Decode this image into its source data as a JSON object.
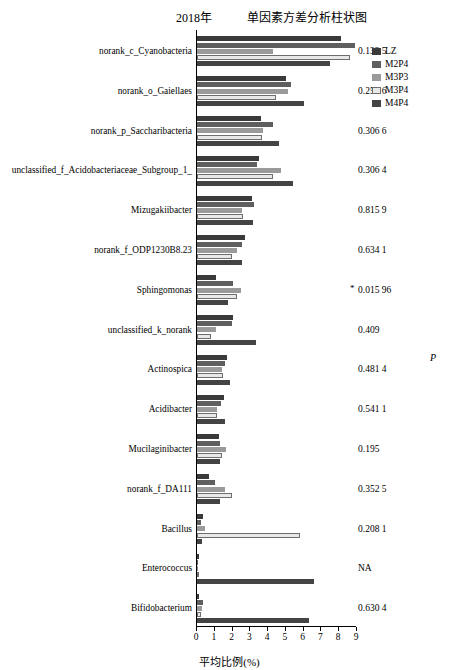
{
  "header": {
    "year": "2018年",
    "title": "单因素方差分析柱状图"
  },
  "legend": {
    "title": "",
    "items": [
      {
        "label": "LZ",
        "color": "#3a3a3a"
      },
      {
        "label": "M2P4",
        "color": "#5f5f5f"
      },
      {
        "label": "M3P3",
        "color": "#9a9a9a"
      },
      {
        "label": "M3P4",
        "color": "#e8e8e8"
      },
      {
        "label": "M4P4",
        "color": "#444444"
      }
    ]
  },
  "p_column_mark": "P",
  "chart_data": {
    "type": "bar",
    "title": "单因素方差分析柱状图",
    "xlabel": "平均比例(%)",
    "ylabel": "",
    "xlim": [
      0,
      9
    ],
    "xticks": [
      0,
      1,
      2,
      3,
      4,
      5,
      6,
      7,
      8,
      9
    ],
    "grid": false,
    "legend_position": "top-right",
    "orientation": "horizontal",
    "categories": [
      "norank_c_Cyanobacteria",
      "norank_o_Gaiellaes",
      "norank_p_Saccharibacteria",
      "unclassified_f_Acidobacteriaceae_Subgroup_1_",
      "Mizugakiibacter",
      "norank_f_ODP1230B8.23",
      "Sphingomonas",
      "unclassified_k_norank",
      "Actinospica",
      "Acidibacter",
      "Mucilaginibacter",
      "norank_f_DA111",
      "Bacillus",
      "Enterococcus",
      "Bifidobacterium"
    ],
    "series": [
      {
        "name": "LZ",
        "values": [
          8.1,
          5.0,
          3.6,
          3.5,
          3.1,
          2.7,
          1.05,
          2.0,
          1.7,
          1.5,
          1.25,
          0.7,
          0.35,
          0.1,
          0.12
        ]
      },
      {
        "name": "M2P4",
        "values": [
          8.9,
          5.3,
          4.3,
          3.4,
          3.2,
          2.55,
          2.05,
          1.95,
          1.55,
          1.35,
          1.3,
          1.0,
          0.25,
          0.08,
          0.35
        ]
      },
      {
        "name": "M3P3",
        "values": [
          4.3,
          5.1,
          3.7,
          4.7,
          2.55,
          2.25,
          2.5,
          1.05,
          1.4,
          1.15,
          1.65,
          1.55,
          0.45,
          0.06,
          0.28
        ]
      },
      {
        "name": "M3P4",
        "values": [
          8.6,
          4.45,
          3.65,
          4.25,
          2.6,
          1.95,
          2.25,
          0.8,
          1.45,
          1.1,
          1.4,
          1.95,
          5.8,
          0.05,
          0.22
        ]
      },
      {
        "name": "M4P4",
        "values": [
          7.5,
          6.0,
          4.6,
          5.4,
          3.15,
          2.55,
          1.75,
          3.3,
          1.85,
          1.55,
          1.3,
          1.3,
          0.3,
          6.6,
          6.3
        ]
      }
    ],
    "p_values": [
      "0.132 5",
      "0.251 6",
      "0.306 6",
      "0.306 4",
      "0.815 9",
      "0.634 1",
      "0.015 96",
      "0.409",
      "0.481 4",
      "0.541 1",
      "0.195",
      "0.352 5",
      "0.208 1",
      "NA",
      "0.630 4"
    ],
    "significance_marks": [
      "",
      "",
      "",
      "",
      "",
      "",
      "*",
      "",
      "",
      "",
      "",
      "",
      "",
      "",
      ""
    ]
  }
}
